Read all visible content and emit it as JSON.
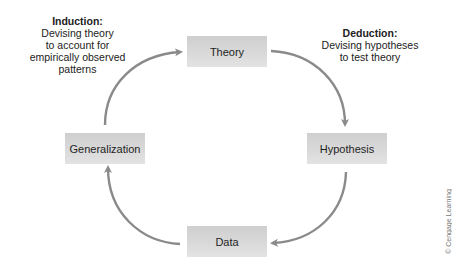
{
  "nodes": {
    "theory": {
      "label": "Theory"
    },
    "hypothesis": {
      "label": "Hypothesis"
    },
    "data": {
      "label": "Data"
    },
    "generalization": {
      "label": "Generalization"
    }
  },
  "annotations": {
    "induction": {
      "title": "Induction:",
      "lines": [
        "Devising theory",
        "to account for",
        "empirically observed",
        "patterns"
      ]
    },
    "deduction": {
      "title": "Deduction:",
      "lines": [
        "Devising hypotheses",
        "to test theory"
      ]
    }
  },
  "edges": [
    {
      "from": "generalization",
      "to": "theory",
      "label": "induction"
    },
    {
      "from": "theory",
      "to": "hypothesis",
      "label": "deduction"
    },
    {
      "from": "hypothesis",
      "to": "data"
    },
    {
      "from": "data",
      "to": "generalization"
    }
  ],
  "credit": "© Cengage Learning",
  "colors": {
    "arrow": "#8a8a8a",
    "box_top": "#cfcfcf",
    "box_bottom": "#e3e3e3",
    "text": "#1e1e1e"
  }
}
